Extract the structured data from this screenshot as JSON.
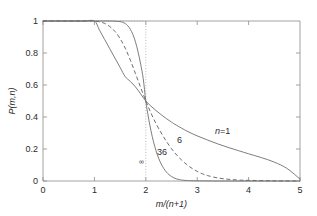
{
  "chart_data": {
    "type": "line",
    "title": "",
    "xlabel": "m/(n+1)",
    "ylabel": "P(m,n)",
    "xlim": [
      0,
      5
    ],
    "ylim": [
      0,
      1
    ],
    "xticks": [
      "0",
      "1",
      "2",
      "3",
      "4",
      "5"
    ],
    "yticks": [
      "0",
      "0.2",
      "0.4",
      "0.6",
      "0.8",
      "1"
    ],
    "grid": false,
    "legend_position": "inline-annotations",
    "crossing_point": {
      "x": 2,
      "y": 0.5
    },
    "annotations": [
      {
        "label": "n=1",
        "x": 3.35,
        "y": 0.275,
        "style": "italic-n"
      },
      {
        "label": "6",
        "x": 2.62,
        "y": 0.215,
        "style": "plain"
      },
      {
        "label": "36",
        "x": 2.33,
        "y": 0.155,
        "style": "plain"
      },
      {
        "label": "∞",
        "x": 2.02,
        "y": 0.068,
        "style": "plain-small"
      }
    ],
    "series": [
      {
        "name": "n=1",
        "linestyle": "solid",
        "x": [
          0,
          0.2,
          0.4,
          0.6,
          0.8,
          1.0,
          1.1,
          1.2,
          1.3,
          1.4,
          1.5,
          1.6,
          1.7,
          1.8,
          1.9,
          2.0,
          2.1,
          2.2,
          2.3,
          2.4,
          2.5,
          2.6,
          2.8,
          3.0,
          3.2,
          3.4,
          3.6,
          3.8,
          4.0,
          4.25,
          4.5,
          4.75,
          5.0
        ],
        "y": [
          1.0,
          1.0,
          1.0,
          1.0,
          1.0,
          1.0,
          0.942,
          0.884,
          0.826,
          0.768,
          0.71,
          0.652,
          0.622,
          0.588,
          0.544,
          0.5,
          0.468,
          0.44,
          0.414,
          0.39,
          0.368,
          0.348,
          0.312,
          0.282,
          0.256,
          0.232,
          0.21,
          0.19,
          0.17,
          0.146,
          0.118,
          0.078,
          0.012
        ]
      },
      {
        "name": "6",
        "linestyle": "dashed",
        "x": [
          0,
          0.3,
          0.6,
          0.9,
          1.0,
          1.1,
          1.2,
          1.3,
          1.4,
          1.5,
          1.6,
          1.7,
          1.8,
          1.9,
          2.0,
          2.1,
          2.2,
          2.3,
          2.4,
          2.5,
          2.6,
          2.7,
          2.8,
          2.9,
          3.0,
          3.1,
          3.2,
          3.4,
          3.6,
          3.8,
          4.0,
          4.5,
          5.0
        ],
        "y": [
          1.0,
          1.0,
          1.0,
          1.0,
          1.0,
          0.995,
          0.985,
          0.965,
          0.935,
          0.89,
          0.83,
          0.755,
          0.67,
          0.585,
          0.5,
          0.425,
          0.358,
          0.3,
          0.248,
          0.202,
          0.163,
          0.13,
          0.102,
          0.079,
          0.06,
          0.045,
          0.034,
          0.019,
          0.011,
          0.006,
          0.004,
          0.001,
          0.0
        ]
      },
      {
        "name": "36",
        "linestyle": "solid",
        "x": [
          0,
          0.4,
          0.8,
          1.1,
          1.3,
          1.4,
          1.5,
          1.55,
          1.6,
          1.65,
          1.7,
          1.75,
          1.8,
          1.85,
          1.9,
          1.95,
          2.0,
          2.05,
          2.1,
          2.15,
          2.2,
          2.25,
          2.3,
          2.35,
          2.4,
          2.45,
          2.5,
          2.55,
          2.6,
          2.65,
          2.7,
          2.8,
          3.0,
          3.5,
          4.0,
          5.0
        ],
        "y": [
          1.0,
          1.0,
          1.0,
          1.0,
          1.0,
          0.999,
          0.996,
          0.992,
          0.984,
          0.97,
          0.948,
          0.915,
          0.868,
          0.806,
          0.73,
          0.64,
          0.5,
          0.4,
          0.315,
          0.245,
          0.188,
          0.142,
          0.106,
          0.078,
          0.056,
          0.04,
          0.028,
          0.019,
          0.013,
          0.009,
          0.006,
          0.003,
          0.001,
          0.0,
          0.0,
          0.0
        ]
      },
      {
        "name": "∞",
        "linestyle": "dotted",
        "description": "step function: 1 for x<2, 0 for x>2",
        "x": [
          1.5,
          2.0,
          2.0
        ],
        "y": [
          1.0,
          1.0,
          0.0
        ]
      }
    ]
  }
}
